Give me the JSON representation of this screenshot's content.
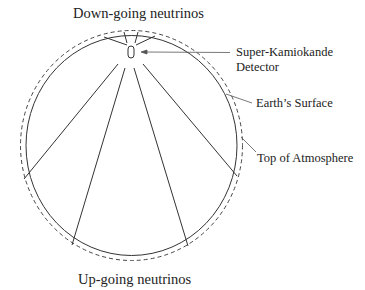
{
  "diagram": {
    "top_label": "Down-going neutrinos",
    "bottom_label": "Up-going neutrinos",
    "callouts": {
      "detector_line1": "Super-Kamiokande",
      "detector_line2": "Detector",
      "earth_surface": "Earth’s Surface",
      "atmosphere": "Top of Atmosphere"
    },
    "elements": [
      {
        "name": "earth-surface",
        "shape": "solid circle"
      },
      {
        "name": "top-of-atmosphere",
        "shape": "dashed circle"
      },
      {
        "name": "super-kamiokande-detector",
        "shape": "small oval near top"
      },
      {
        "name": "down-going-neutrino-paths",
        "count": 4
      },
      {
        "name": "up-going-neutrino-paths",
        "count": 4
      }
    ],
    "colors": {
      "stroke": "#333333",
      "background": "#ffffff",
      "text": "#222222"
    }
  }
}
